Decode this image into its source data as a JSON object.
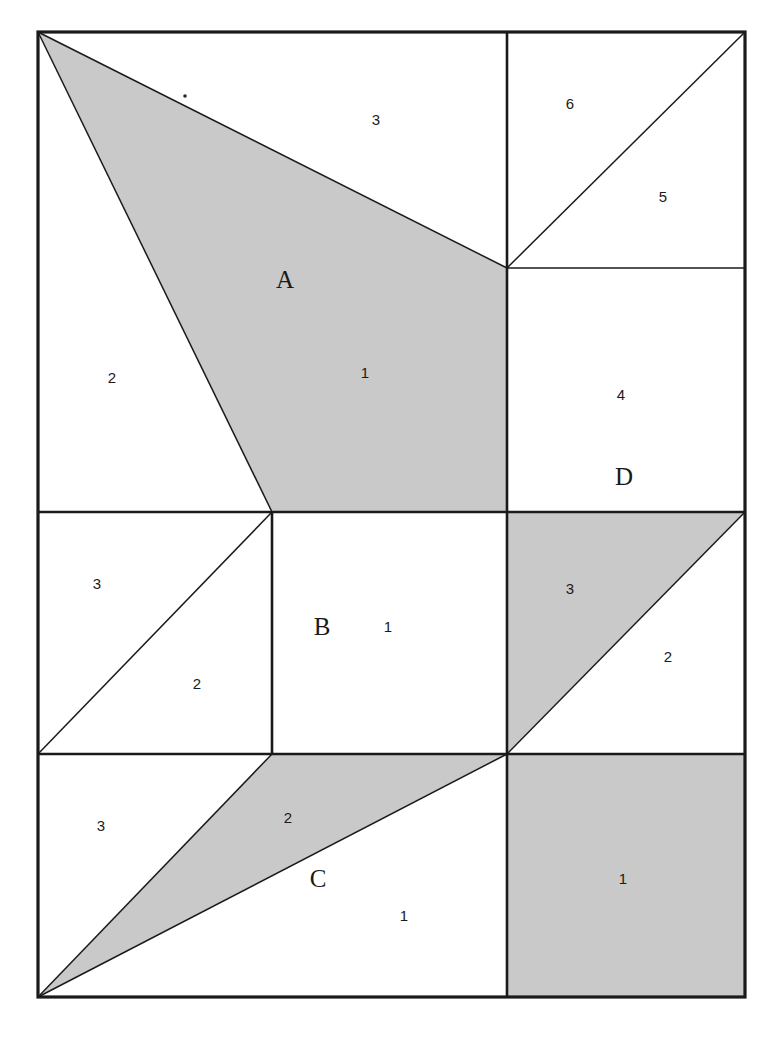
{
  "figure": {
    "background_color": "#ffffff",
    "line_color": "#1a1a1a",
    "shaded_color": "#c9c9c9",
    "unshaded_color": "#ffffff",
    "frame": {
      "left": 38,
      "top": 32,
      "right": 745,
      "bottom": 997
    },
    "grid": {
      "vertical_x": 272,
      "vertical_x2": 507,
      "horizontal_y1": 512,
      "horizontal_y2": 754
    }
  },
  "regions": {
    "top_left": {
      "letter": "A",
      "shaded": true,
      "labels": [
        {
          "text": "3",
          "x": 376,
          "y": 120
        },
        {
          "text": "2",
          "x": 112,
          "y": 378
        },
        {
          "text": "1",
          "x": 365,
          "y": 373
        }
      ],
      "letter_position": {
        "x": 285,
        "y": 288
      }
    },
    "top_right_upper": {
      "shaded": false,
      "labels": [
        {
          "text": "6",
          "x": 570,
          "y": 104
        },
        {
          "text": "5",
          "x": 663,
          "y": 197
        }
      ]
    },
    "right_middle_upper": {
      "letter": "D",
      "shaded": false,
      "labels": [
        {
          "text": "4",
          "x": 621,
          "y": 395
        }
      ],
      "letter_position": {
        "x": 624,
        "y": 477
      }
    },
    "mid_left": {
      "shaded": false,
      "labels": [
        {
          "text": "3",
          "x": 97,
          "y": 584
        },
        {
          "text": "2",
          "x": 197,
          "y": 684
        }
      ]
    },
    "mid_center": {
      "letter": "B",
      "shaded": false,
      "labels": [
        {
          "text": "1",
          "x": 388,
          "y": 627
        }
      ],
      "letter_position": {
        "x": 322,
        "y": 627
      }
    },
    "mid_right": {
      "shaded_triangle": true,
      "labels": [
        {
          "text": "3",
          "x": 570,
          "y": 589
        },
        {
          "text": "2",
          "x": 668,
          "y": 657
        }
      ]
    },
    "bottom_left": {
      "letter": "C",
      "shaded": true,
      "labels": [
        {
          "text": "3",
          "x": 101,
          "y": 826
        },
        {
          "text": "2",
          "x": 288,
          "y": 818
        },
        {
          "text": "1",
          "x": 404,
          "y": 916
        }
      ],
      "letter_position": {
        "x": 318,
        "y": 879
      }
    },
    "bottom_right": {
      "shaded": true,
      "labels": [
        {
          "text": "1",
          "x": 623,
          "y": 879
        }
      ]
    }
  },
  "shapes": {
    "region_a_polygon": "38,32 507,268 507,512 272,512",
    "region_a_line_upper": "38,32 507,268",
    "region_a_line_lower": "38,32 272,512",
    "top_right_diagonal": "507,268 745,32",
    "mid_left_diagonal": "38,754 272,512",
    "mid_right_diagonal": "507,754 745,512",
    "mid_right_shaded_triangle": "507,512 745,512 507,754",
    "region_c_line_upper": "38,997 272,754",
    "region_c_line_lower": "38,997 507,754",
    "region_c_shaded_polygon": "38,997 272,754 507,754",
    "region_c_lower_polygon": "38,997 507,754 507,997",
    "bottom_right_rect": "507,754 745,754 745,997 507,997"
  }
}
